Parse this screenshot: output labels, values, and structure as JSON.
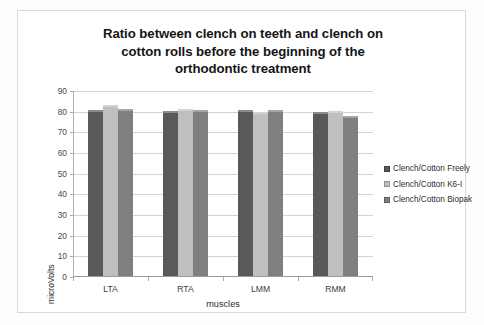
{
  "chart_data": {
    "type": "bar",
    "title": "Ratio between clench on teeth and clench on cotton rolls before the beginning of the orthodontic treatment",
    "title_lines": [
      "Ratio between clench on teeth and clench on",
      "cotton rolls before the beginning of the",
      "orthodontic treatment"
    ],
    "xlabel": "muscles",
    "ylabel": "microVolts",
    "categories": [
      "LTA",
      "RTA",
      "LMM",
      "RMM"
    ],
    "yticks": [
      0,
      10,
      20,
      30,
      40,
      50,
      60,
      70,
      80,
      90
    ],
    "ylim": [
      0,
      90
    ],
    "grid": true,
    "legend_position": "right",
    "series": [
      {
        "name": "Clench/Cotton Freely",
        "color": "#595959",
        "values": [
          81,
          80.5,
          81,
          80
        ]
      },
      {
        "name": "Clench/Cotton K6-I",
        "color": "#bfbfbf",
        "values": [
          83,
          81.5,
          80,
          80.5
        ]
      },
      {
        "name": "Clench/Cotton Biopak",
        "color": "#7f7f7f",
        "values": [
          81.5,
          81,
          81,
          78
        ]
      }
    ]
  }
}
